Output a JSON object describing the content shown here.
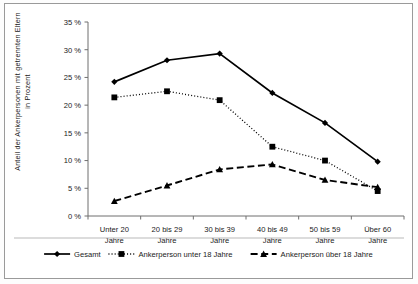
{
  "chart_data": {
    "type": "line",
    "title": "",
    "xlabel": "",
    "ylabel": "Anteil der Ankerpersonen mit getrennten Eltern in Prozent",
    "categories": [
      "Unter 20 Jahre",
      "20 bis 29 Jahre",
      "30 bis 39 Jahre",
      "40 bis 49 Jahre",
      "50 bis 59 Jahre",
      "Über 60 Jahre"
    ],
    "category_lines": [
      [
        "Unter 20",
        "Jahre"
      ],
      [
        "20 bis 29",
        "Jahre"
      ],
      [
        "30 bis 39",
        "Jahre"
      ],
      [
        "40 bis 49",
        "Jahre"
      ],
      [
        "50 bis 59",
        "Jahre"
      ],
      [
        "Über 60",
        "Jahre"
      ]
    ],
    "ylim": [
      0,
      35
    ],
    "ytick_labels": [
      "0 %",
      "5 %",
      "10 %",
      "15 %",
      "20 %",
      "25 %",
      "30 %",
      "35 %"
    ],
    "ytick_values": [
      0,
      5,
      10,
      15,
      20,
      25,
      30,
      35
    ],
    "grid": false,
    "legend_position": "bottom",
    "series": [
      {
        "name": "Gesamt",
        "marker": "diamond",
        "line_style": "solid",
        "color": "#000000",
        "values": [
          24.2,
          28.1,
          29.3,
          22.2,
          16.8,
          9.8
        ]
      },
      {
        "name": "Ankerperson unter 18 Jahre",
        "marker": "square",
        "line_style": "dotted",
        "color": "#000000",
        "values": [
          21.4,
          22.5,
          20.9,
          12.5,
          10.0,
          4.5
        ]
      },
      {
        "name": "Ankerperson über 18 Jahre",
        "marker": "triangle",
        "line_style": "dashed",
        "color": "#000000",
        "values": [
          2.7,
          5.5,
          8.4,
          9.3,
          6.5,
          5.2
        ]
      }
    ]
  }
}
